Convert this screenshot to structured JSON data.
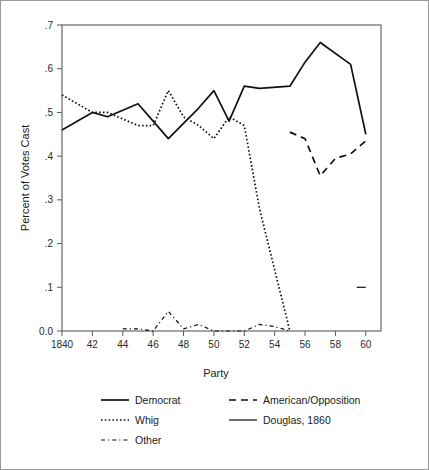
{
  "chart_data": {
    "type": "line",
    "title": "",
    "xlabel": "Party",
    "ylabel": "Percent of Votes Cast",
    "xlim": [
      1840,
      1861
    ],
    "ylim": [
      0.0,
      0.7
    ],
    "grid": false,
    "legend_position": "bottom",
    "x_tick_labels": [
      "1840",
      "42",
      "44",
      "46",
      "48",
      "50",
      "52",
      "54",
      "56",
      "58",
      "60"
    ],
    "x_tick_values": [
      1840,
      1842,
      1844,
      1846,
      1848,
      1850,
      1852,
      1854,
      1856,
      1858,
      1860
    ],
    "y_tick_labels": [
      "0.0",
      ".1",
      ".2",
      ".3",
      ".4",
      ".5",
      ".6",
      ".7"
    ],
    "y_tick_values": [
      0.0,
      0.1,
      0.2,
      0.3,
      0.4,
      0.5,
      0.6,
      0.7
    ],
    "series": [
      {
        "name": "Democrat",
        "style": "solid",
        "x": [
          1840,
          1842,
          1843,
          1845,
          1846,
          1847,
          1849,
          1850,
          1851,
          1852,
          1853,
          1855,
          1856,
          1857,
          1859,
          1860
        ],
        "values": [
          0.46,
          0.5,
          0.49,
          0.52,
          0.48,
          0.44,
          0.51,
          0.55,
          0.48,
          0.56,
          0.555,
          0.56,
          0.615,
          0.66,
          0.61,
          0.45
        ]
      },
      {
        "name": "Whig",
        "style": "dotted",
        "x": [
          1840,
          1842,
          1843,
          1845,
          1846,
          1847,
          1848,
          1849,
          1850,
          1851,
          1852,
          1853,
          1855
        ],
        "values": [
          0.54,
          0.5,
          0.5,
          0.47,
          0.47,
          0.55,
          0.49,
          0.47,
          0.44,
          0.49,
          0.47,
          0.28,
          0.0
        ]
      },
      {
        "name": "Other",
        "style": "dashdot",
        "x": [
          1844,
          1845,
          1846,
          1847,
          1848,
          1849,
          1850,
          1851,
          1852,
          1853,
          1854,
          1855
        ],
        "values": [
          0.005,
          0.005,
          0.0,
          0.045,
          0.005,
          0.015,
          0.0,
          0.0,
          0.0,
          0.015,
          0.01,
          0.0
        ]
      },
      {
        "name": "American/Opposition",
        "style": "longdash",
        "x": [
          1855,
          1856,
          1857,
          1858,
          1859,
          1860
        ],
        "values": [
          0.455,
          0.44,
          0.355,
          0.395,
          0.405,
          0.435
        ]
      },
      {
        "name": "Douglas, 1860",
        "style": "solid-thin",
        "x": [
          1859.4,
          1860.0
        ],
        "values": [
          0.1,
          0.1
        ]
      }
    ]
  },
  "axes": {
    "x_title": "Party",
    "y_title": "Percent of Votes Cast"
  },
  "legend": {
    "entries": [
      {
        "label": "Democrat",
        "style": "solid",
        "column": 1
      },
      {
        "label": "Whig",
        "style": "dotted",
        "column": 1
      },
      {
        "label": "Other",
        "style": "dashdot",
        "column": 1
      },
      {
        "label": "American/Opposition",
        "style": "longdash",
        "column": 2
      },
      {
        "label": "Douglas, 1860",
        "style": "solid-thin",
        "column": 2
      }
    ]
  },
  "colors": {
    "ink": "#111111",
    "axis": "#5a5a5a",
    "background": "#ffffff",
    "border": "#9a9a9a"
  }
}
